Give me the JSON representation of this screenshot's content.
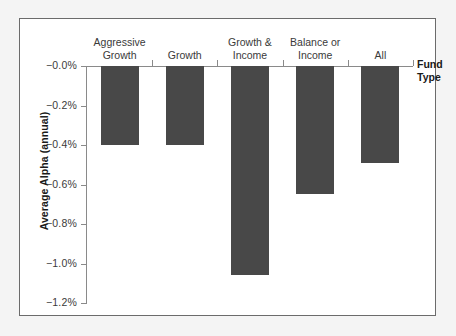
{
  "chart_data": {
    "type": "bar",
    "title": "",
    "subtitle": "",
    "xlabel": "Fund\nType",
    "ylabel": "Average Alpha (annual)",
    "categories": [
      "Aggressive\nGrowth",
      "Growth",
      "Growth &\nIncome",
      "Balance or\nIncome",
      "All"
    ],
    "values": [
      -0.4,
      -0.4,
      -1.06,
      -0.65,
      -0.49
    ],
    "ylim": [
      -1.2,
      0.0
    ],
    "ytick_labels": [
      "−0.0%",
      "−0.2%",
      "−0.4%",
      "−0.6%",
      "−0.8%",
      "−1.0%",
      "−1.2%"
    ],
    "ytick_values": [
      0.0,
      -0.2,
      -0.4,
      -0.6,
      -0.8,
      -1.0,
      -1.2
    ],
    "grid": false,
    "legend": null,
    "bar_color": "#484848",
    "axis_color": "#8a8a8a",
    "text_color": "#3a3a3a",
    "panel_background": "#ffffff",
    "page_background": "#f4f4f4",
    "border_color": "#6b6b6b"
  },
  "axis": {
    "y_title": "Average Alpha (annual)",
    "x_title": "Fund\nType",
    "ticks": [
      {
        "label": "−0.0%",
        "value": 0.0
      },
      {
        "label": "−0.2%",
        "value": -0.2
      },
      {
        "label": "−0.4%",
        "value": -0.4
      },
      {
        "label": "−0.6%",
        "value": -0.6
      },
      {
        "label": "−0.8%",
        "value": -0.8
      },
      {
        "label": "−1.0%",
        "value": -1.0
      },
      {
        "label": "−1.2%",
        "value": -1.2
      }
    ]
  },
  "bars": [
    {
      "label": "Aggressive\nGrowth",
      "value": -0.4
    },
    {
      "label": "Growth",
      "value": -0.4
    },
    {
      "label": "Growth &\nIncome",
      "value": -1.06
    },
    {
      "label": "Balance or\nIncome",
      "value": -0.65
    },
    {
      "label": "All",
      "value": -0.49
    }
  ]
}
